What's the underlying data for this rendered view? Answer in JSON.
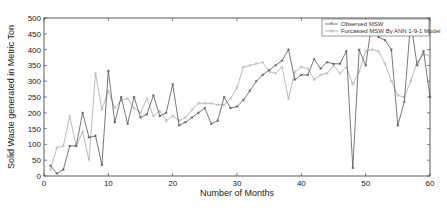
{
  "chart_data": {
    "type": "line",
    "title": "",
    "xlabel": "Number of Months",
    "ylabel": "Solid Waste generated in Metric Ton",
    "xlim": [
      0,
      60
    ],
    "ylim": [
      0,
      500
    ],
    "xticks": [
      0,
      10,
      20,
      30,
      40,
      50,
      60
    ],
    "yticks": [
      0,
      50,
      100,
      150,
      200,
      250,
      300,
      350,
      400,
      450,
      500
    ],
    "grid": false,
    "legend_position": "top-right",
    "x": [
      1,
      2,
      3,
      4,
      5,
      6,
      7,
      8,
      9,
      10,
      11,
      12,
      13,
      14,
      15,
      16,
      17,
      18,
      19,
      20,
      21,
      22,
      23,
      24,
      25,
      26,
      27,
      28,
      29,
      30,
      31,
      32,
      33,
      34,
      35,
      36,
      37,
      38,
      39,
      40,
      41,
      42,
      43,
      44,
      45,
      46,
      47,
      48,
      49,
      50,
      51,
      52,
      53,
      54,
      55,
      56,
      57,
      58,
      59,
      60
    ],
    "series": [
      {
        "name": "Observed MSW",
        "color": "#555555",
        "marker": "*",
        "values": [
          33,
          8,
          20,
          95,
          95,
          200,
          122,
          127,
          35,
          333,
          170,
          250,
          165,
          250,
          185,
          195,
          255,
          190,
          200,
          290,
          160,
          170,
          185,
          200,
          215,
          165,
          175,
          250,
          215,
          220,
          240,
          270,
          300,
          320,
          335,
          350,
          365,
          400,
          305,
          320,
          320,
          370,
          340,
          360,
          355,
          355,
          395,
          25,
          400,
          350,
          490,
          440,
          430,
          400,
          160,
          235,
          490,
          350,
          395,
          250
        ]
      },
      {
        "name": "Forcasted MSW By ANN 1-9-1 Model",
        "color": "#aaaaaa",
        "marker": "o",
        "values": [
          20,
          90,
          95,
          190,
          95,
          140,
          50,
          325,
          210,
          270,
          215,
          240,
          245,
          215,
          200,
          245,
          190,
          205,
          175,
          190,
          175,
          185,
          210,
          230,
          230,
          230,
          225,
          225,
          245,
          280,
          345,
          350,
          355,
          360,
          330,
          325,
          345,
          245,
          330,
          345,
          340,
          305,
          320,
          325,
          350,
          325,
          345,
          290,
          330,
          395,
          400,
          395,
          355,
          300,
          255,
          250,
          300,
          360,
          385,
          380
        ]
      }
    ]
  }
}
